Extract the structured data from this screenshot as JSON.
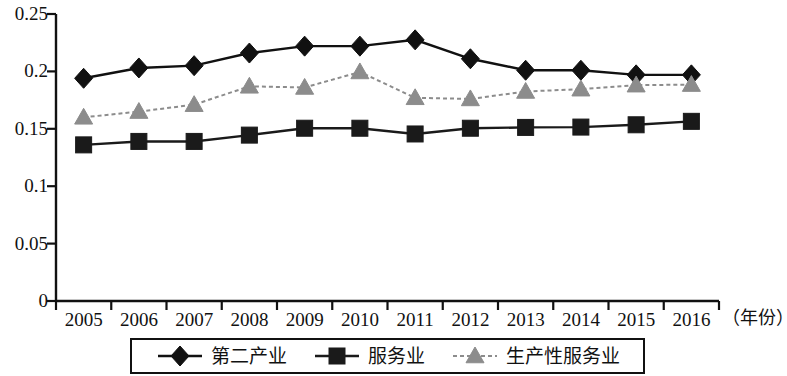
{
  "chart_data": {
    "type": "line",
    "title": "",
    "subtitle": "",
    "xlabel": "（年份）",
    "ylabel": "",
    "grid": false,
    "legend_position": "bottom",
    "categories": [
      "2005",
      "2006",
      "2007",
      "2008",
      "2009",
      "2010",
      "2011",
      "2012",
      "2013",
      "2014",
      "2015",
      "2016"
    ],
    "xlim": [
      2005,
      2016
    ],
    "ylim": [
      0,
      0.25
    ],
    "ytick_labels": [
      "0",
      "0.05",
      "0.1",
      "0.15",
      "0.2",
      "0.25"
    ],
    "ytick_values": [
      0,
      0.05,
      0.1,
      0.15,
      0.2,
      0.25
    ],
    "series": [
      {
        "name": "第二产业",
        "marker": "diamond",
        "color": "#111111",
        "line_style": "solid",
        "values": [
          0.194,
          0.203,
          0.205,
          0.216,
          0.222,
          0.222,
          0.2275,
          0.211,
          0.201,
          0.201,
          0.197,
          0.197
        ]
      },
      {
        "name": "服务业",
        "marker": "square",
        "color": "#1a1a1a",
        "line_style": "solid",
        "values": [
          0.136,
          0.139,
          0.139,
          0.1445,
          0.1505,
          0.1505,
          0.1455,
          0.1505,
          0.1512,
          0.1515,
          0.1535,
          0.1565
        ]
      },
      {
        "name": "生产性服务业",
        "marker": "triangle",
        "color": "#8c8c8c",
        "line_style": "dashed",
        "values": [
          0.16,
          0.165,
          0.171,
          0.187,
          0.186,
          0.1995,
          0.177,
          0.176,
          0.1825,
          0.1845,
          0.188,
          0.1885
        ]
      }
    ]
  },
  "legend": {
    "items": [
      {
        "label": "第二产业",
        "marker": "diamond-marker",
        "color": "#111111"
      },
      {
        "label": "服务业",
        "marker": "square-marker",
        "color": "#1a1a1a"
      },
      {
        "label": "生产性服务业",
        "marker": "triangle-marker",
        "color": "#8c8c8c"
      }
    ]
  },
  "axes": {
    "x_title": "（年份）"
  }
}
